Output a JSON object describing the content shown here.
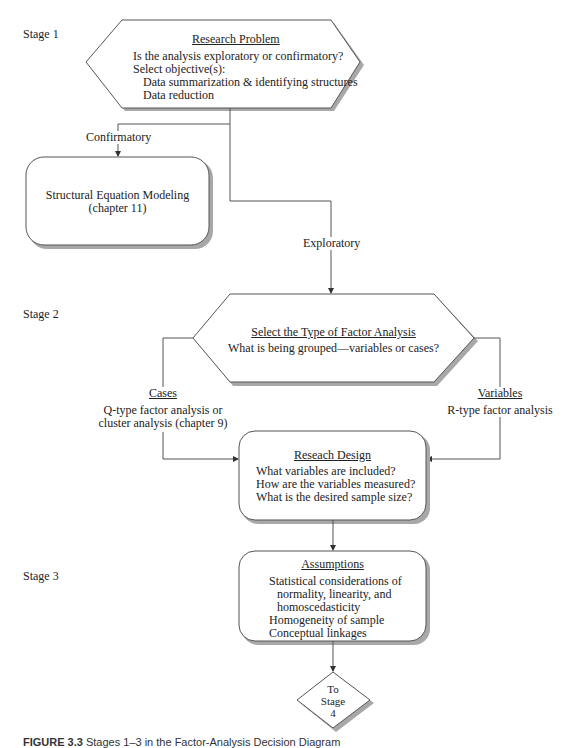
{
  "stages": {
    "stage1": "Stage 1",
    "stage2": "Stage 2",
    "stage3": "Stage 3"
  },
  "research_problem": {
    "title": "Research Problem",
    "lines": [
      "Is the analysis exploratory or confirmatory?",
      "Select objective(s):",
      "Data summarization & identifying structures",
      "Data reduction"
    ]
  },
  "branches": {
    "confirmatory": "Confirmatory",
    "exploratory": "Exploratory"
  },
  "sem_box": {
    "line1": "Structural Equation Modeling",
    "line2": "(chapter 11)"
  },
  "factor_type": {
    "title": "Select the Type of Factor Analysis",
    "question": "What is being grouped—variables or cases?"
  },
  "cases": {
    "title": "Cases",
    "line1": "Q-type factor analysis or",
    "line2": "cluster analysis (chapter 9)"
  },
  "variables": {
    "title": "Variables",
    "line1": "R-type factor analysis"
  },
  "research_design": {
    "title": "Reseach Design",
    "lines": [
      "What variables are included?",
      "How are the variables measured?",
      "What is the desired sample size?"
    ]
  },
  "assumptions": {
    "title": "Assumptions",
    "lines": [
      "Statistical considerations of",
      "normality, linearity, and",
      "homoscedasticity",
      "Homogeneity of sample",
      "Conceptual linkages"
    ]
  },
  "to_stage": {
    "line1": "To",
    "line2": "Stage",
    "line3": "4"
  },
  "caption": {
    "label": "FIGURE 3.3",
    "text": "Stages 1–3 in the Factor-Analysis Decision Diagram"
  },
  "colors": {
    "line": "#555555",
    "shadow": "#a8a8a8",
    "text": "#222222"
  }
}
